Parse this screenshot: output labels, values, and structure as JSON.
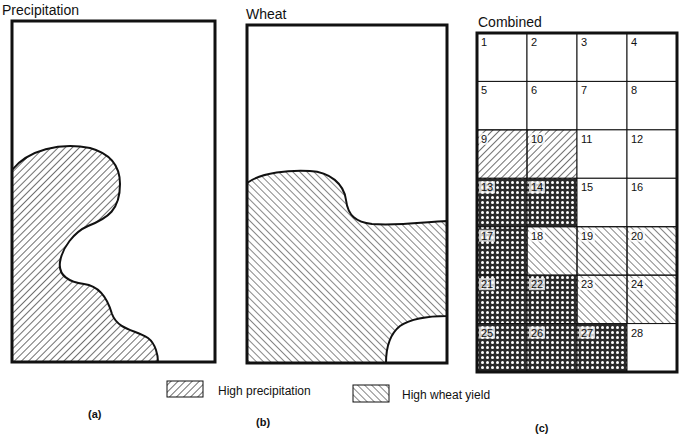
{
  "panels": {
    "a": {
      "title": "Precipitation",
      "caption": "(a)"
    },
    "b": {
      "title": "Wheat",
      "caption": "(b)"
    },
    "c": {
      "title": "Combined",
      "caption": "(c)"
    }
  },
  "legend": {
    "items": [
      {
        "pattern": "backslash-hatch",
        "label": "High precipitation"
      },
      {
        "pattern": "slash-hatch",
        "label": "High wheat yield"
      }
    ]
  },
  "grid": {
    "columns": 4,
    "rows": 7,
    "cells": [
      {
        "n": "1",
        "fill": "none"
      },
      {
        "n": "2",
        "fill": "none"
      },
      {
        "n": "3",
        "fill": "none"
      },
      {
        "n": "4",
        "fill": "none"
      },
      {
        "n": "5",
        "fill": "none"
      },
      {
        "n": "6",
        "fill": "none"
      },
      {
        "n": "7",
        "fill": "none"
      },
      {
        "n": "8",
        "fill": "none"
      },
      {
        "n": "9",
        "fill": "precip"
      },
      {
        "n": "10",
        "fill": "precip"
      },
      {
        "n": "11",
        "fill": "none"
      },
      {
        "n": "12",
        "fill": "none"
      },
      {
        "n": "13",
        "fill": "both"
      },
      {
        "n": "14",
        "fill": "both"
      },
      {
        "n": "15",
        "fill": "none"
      },
      {
        "n": "16",
        "fill": "none"
      },
      {
        "n": "17",
        "fill": "both"
      },
      {
        "n": "18",
        "fill": "wheat"
      },
      {
        "n": "19",
        "fill": "wheat"
      },
      {
        "n": "20",
        "fill": "wheat"
      },
      {
        "n": "21",
        "fill": "both"
      },
      {
        "n": "22",
        "fill": "both"
      },
      {
        "n": "23",
        "fill": "wheat"
      },
      {
        "n": "24",
        "fill": "wheat"
      },
      {
        "n": "25",
        "fill": "both"
      },
      {
        "n": "26",
        "fill": "both"
      },
      {
        "n": "27",
        "fill": "both"
      },
      {
        "n": "28",
        "fill": "none"
      }
    ]
  },
  "colors": {
    "ink": "#111111",
    "paper": "#ffffff"
  }
}
